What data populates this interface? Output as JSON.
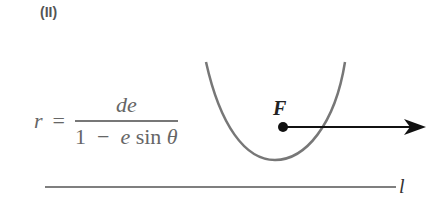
{
  "part_label": "(II)",
  "formula": {
    "lhs": "r",
    "equals": "=",
    "numerator": "de",
    "denominator_one": "1",
    "denominator_minus": "−",
    "denominator_e": "e",
    "denominator_sin": "sin",
    "denominator_theta": "θ"
  },
  "focus_label": "F",
  "directrix_label": "l",
  "colors": {
    "parabola": "#777777",
    "arrow": "#111111",
    "directrix": "#555555",
    "text": "#666666"
  }
}
